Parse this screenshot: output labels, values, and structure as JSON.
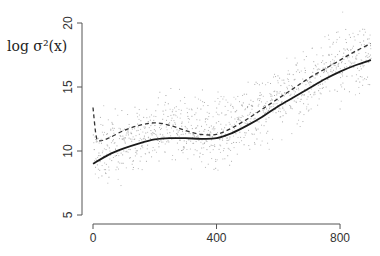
{
  "chart_data": {
    "type": "scatter",
    "title": "",
    "xlabel": "",
    "ylabel": "log σ²(x)",
    "xlim": [
      -35,
      915
    ],
    "ylim": [
      4.3,
      21.6
    ],
    "xticks": [
      0,
      400,
      800
    ],
    "xtick_labels": [
      "0",
      "400",
      "800"
    ],
    "yticks": [
      5,
      10,
      15,
      20
    ],
    "ytick_labels": [
      "5",
      "10",
      "15",
      "20"
    ],
    "grid": false,
    "legend": null,
    "series": [
      {
        "name": "observations",
        "style": "points",
        "color": "#9a9a9a",
        "description": "~1000 scattered points, log variance noise around trend, x from 0 to 900"
      },
      {
        "name": "estimated",
        "style": "solid",
        "color": "#1a1a1a",
        "x": [
          0,
          50,
          100,
          150,
          200,
          250,
          300,
          350,
          400,
          450,
          500,
          550,
          600,
          650,
          700,
          750,
          800,
          850,
          900
        ],
        "values": [
          9.0,
          9.7,
          10.2,
          10.6,
          10.9,
          11.0,
          11.0,
          10.95,
          11.0,
          11.4,
          12.0,
          12.7,
          13.5,
          14.2,
          14.9,
          15.6,
          16.2,
          16.7,
          17.1
        ]
      },
      {
        "name": "true",
        "style": "dashed",
        "color": "#333333",
        "x": [
          0,
          10,
          20,
          50,
          100,
          150,
          200,
          250,
          300,
          350,
          400,
          450,
          500,
          550,
          600,
          650,
          700,
          750,
          800,
          850,
          900
        ],
        "values": [
          13.4,
          11.2,
          10.8,
          11.0,
          11.6,
          12.0,
          12.2,
          12.0,
          11.6,
          11.3,
          11.3,
          11.8,
          12.5,
          13.3,
          14.1,
          14.9,
          15.7,
          16.4,
          17.1,
          17.8,
          18.4
        ]
      }
    ]
  }
}
